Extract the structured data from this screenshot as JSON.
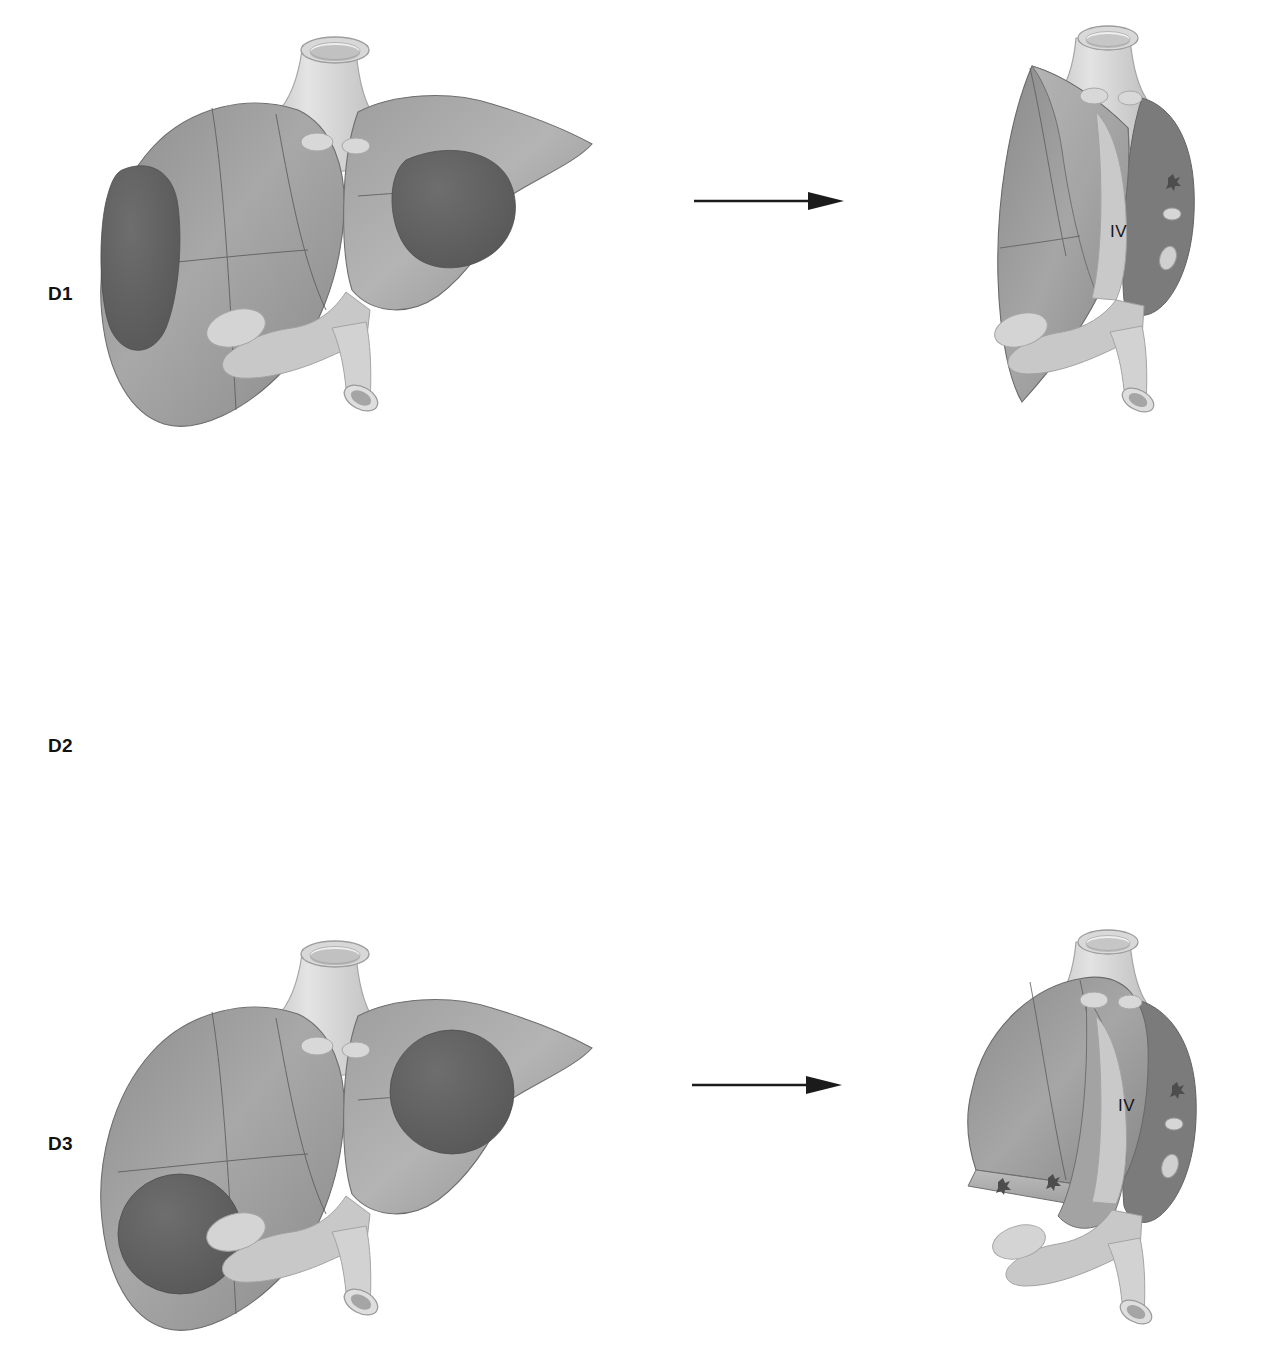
{
  "figure": {
    "type": "medical-illustration",
    "background_color": "#ffffff",
    "rows": [
      {
        "id": "D1",
        "label": "D1",
        "arrow": {
          "name": "right-arrow",
          "direction": "right"
        },
        "before": {
          "caption": "",
          "tumors": [
            {
              "name": "tumor-left-lateral",
              "position": "left-lobe-lateral",
              "shape": "ovoid"
            },
            {
              "name": "tumor-right-upper",
              "position": "right-lobe-superior",
              "shape": "ovoid"
            }
          ]
        },
        "after": {
          "segment_label": "IV",
          "cut_surface": "oblique",
          "vessel_stumps": 0
        }
      },
      {
        "id": "D2",
        "label": "D2",
        "arrow": {
          "name": "right-arrow",
          "direction": "right"
        },
        "before": {
          "caption": "",
          "tumors": [
            {
              "name": "tumor-left-inferior",
              "position": "left-lobe-inferior",
              "shape": "round"
            },
            {
              "name": "tumor-right-upper",
              "position": "right-lobe-superior",
              "shape": "round"
            }
          ]
        },
        "after": {
          "segment_label": "IV",
          "cut_surface": "horizontal-low",
          "vessel_stumps": 2
        }
      },
      {
        "id": "D3",
        "label": "D3",
        "arrow": {
          "name": "right-arrow",
          "direction": "right"
        },
        "before": {
          "caption": "",
          "tumors": [
            {
              "name": "tumor-left-superior",
              "position": "left-lobe-superior",
              "shape": "round"
            },
            {
              "name": "tumor-right-superior",
              "position": "right-lobe-superior",
              "shape": "round"
            }
          ]
        },
        "after": {
          "segment_label": "IV",
          "cut_surface": "horizontal-lowest",
          "vessel_stumps": 2
        }
      }
    ],
    "palette": {
      "liver_light": "#b0b0b0",
      "liver_mid": "#9a9a9a",
      "liver_dark": "#828282",
      "liver_shadow": "#6f6f6f",
      "tumor": "#646464",
      "tumor_dark": "#585858",
      "vessel_light": "#dcdcdc",
      "vessel_mid": "#c6c6c6",
      "vessel_shadow": "#a8a8a8",
      "outline": "#4a4a4a",
      "ink": "#111111"
    },
    "anatomy": {
      "vena_cava": "inferior-vena-cava",
      "portal_vein": "portal-vein",
      "gallbladder": "gallbladder",
      "hepatic_veins": "hepatic-vein-ostia"
    }
  }
}
